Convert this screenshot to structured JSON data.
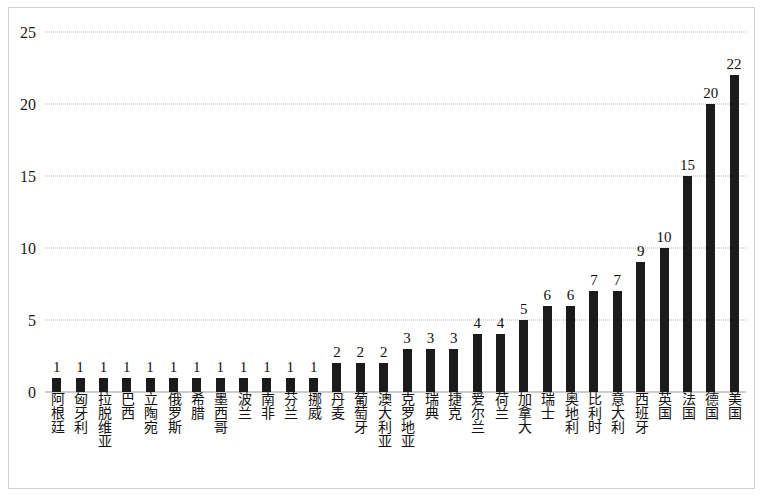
{
  "chart_data": {
    "type": "bar",
    "title": "",
    "subtitle": "",
    "xlabel": "",
    "ylabel": "",
    "ylim": [
      0,
      25
    ],
    "y_ticks": [
      0,
      5,
      10,
      15,
      20,
      25
    ],
    "grid": true,
    "legend": false,
    "bar_color": "#1b1b1b",
    "gridline_color": "#b6b6b6",
    "border_color": "#d2d2d2",
    "show_value_labels": true,
    "categories": [
      "阿根廷",
      "匈牙利",
      "拉脱维亚",
      "巴西",
      "立陶宛",
      "俄罗斯",
      "希腊",
      "墨西哥",
      "波兰",
      "南非",
      "芬兰",
      "挪威",
      "丹麦",
      "葡萄牙",
      "澳大利亚",
      "克罗地亚",
      "瑞典",
      "捷克",
      "爱尔兰",
      "荷兰",
      "加拿大",
      "瑞士",
      "奥地利",
      "比利时",
      "意大利",
      "西班牙",
      "英国",
      "法国",
      "德国",
      "美国"
    ],
    "values": [
      1,
      1,
      1,
      1,
      1,
      1,
      1,
      1,
      1,
      1,
      1,
      1,
      2,
      2,
      2,
      3,
      3,
      3,
      4,
      4,
      5,
      6,
      6,
      7,
      7,
      9,
      10,
      15,
      20,
      22
    ]
  }
}
